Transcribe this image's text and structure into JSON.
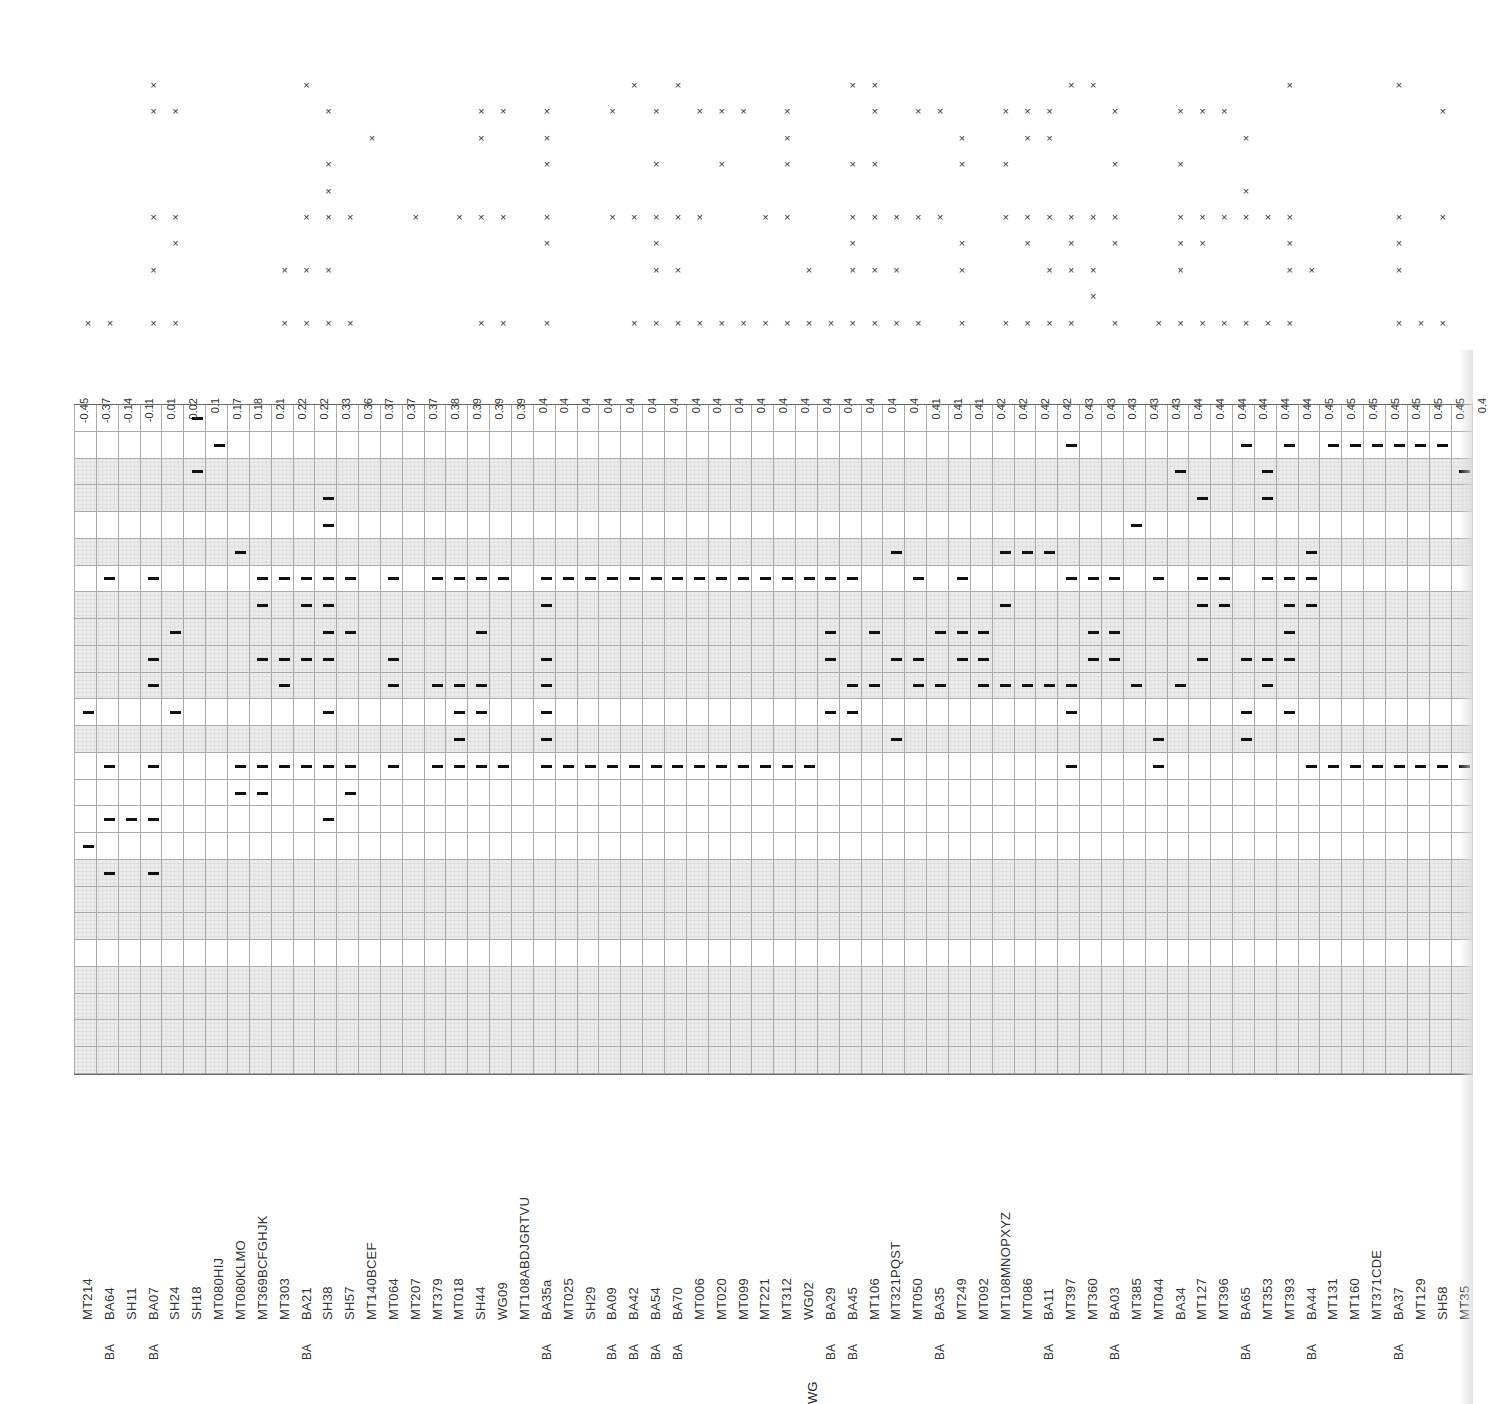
{
  "chart_data": {
    "type": "table",
    "title": "",
    "scores": [
      "-0.45",
      "-0.37",
      "-0.14",
      "-0.11",
      "0.01",
      "0.02",
      "0.1",
      "0.17",
      "0.18",
      "0.21",
      "0.22",
      "0.22",
      "0.33",
      "0.36",
      "0.37",
      "0.37",
      "0.37",
      "0.38",
      "0.39",
      "0.39",
      "0.39",
      "0.4",
      "0.4",
      "0.4",
      "0.4",
      "0.4",
      "0.4",
      "0.4",
      "0.4",
      "0.4",
      "0.4",
      "0.4",
      "0.4",
      "0.4",
      "0.4",
      "0.4",
      "0.4",
      "0.4",
      "0.4",
      "0.41",
      "0.41",
      "0.41",
      "0.42",
      "0.42",
      "0.42",
      "0.42",
      "0.43",
      "0.43",
      "0.43",
      "0.43",
      "0.43",
      "0.44",
      "0.44",
      "0.44",
      "0.44",
      "0.44",
      "0.44",
      "0.45",
      "0.45",
      "0.45",
      "0.45",
      "0.45",
      "0.45",
      "0.45",
      "0.4"
    ],
    "samples": [
      "MT214",
      "BA64",
      "SH11",
      "BA07",
      "SH24",
      "SH18",
      "MT080HIJ",
      "MT080KLMO",
      "MT369BCFGHJK",
      "MT303",
      "BA21",
      "SH38",
      "SH57",
      "MT140BCEF",
      "MT064",
      "MT207",
      "MT379",
      "MT018",
      "SH44",
      "WG09",
      "MT108ABDJGRTVU",
      "BA35a",
      "MT025",
      "SH29",
      "BA09",
      "BA42",
      "BA54",
      "BA70",
      "MT006",
      "MT020",
      "MT099",
      "MT221",
      "MT312",
      "WG02",
      "BA29",
      "BA45",
      "MT106",
      "MT321PQST",
      "MT050",
      "BA35",
      "MT249",
      "MT092",
      "MT108MNOPXYZ",
      "MT086",
      "BA11",
      "MT397",
      "MT360",
      "BA03",
      "MT385",
      "MT044",
      "BA34",
      "MT127",
      "MT396",
      "BA65",
      "MT353",
      "MT393",
      "BA44",
      "MT131",
      "MT160",
      "MT371CDE",
      "BA37",
      "MT129",
      "SH58",
      "MT35"
    ],
    "group_labels": [
      "",
      "BA",
      "",
      "BA",
      "",
      "",
      "",
      "",
      "",
      "",
      "BA",
      "",
      "",
      "",
      "",
      "",
      "",
      "",
      "",
      "",
      "",
      "BA",
      "",
      "",
      "BA",
      "BA",
      "BA",
      "BA",
      "",
      "",
      "",
      "",
      "",
      "",
      "BA",
      "BA",
      "",
      "",
      "",
      "BA",
      "",
      "",
      "",
      "",
      "BA",
      "",
      "",
      "BA",
      "",
      "",
      "",
      "",
      "",
      "BA",
      "",
      "",
      "BA",
      "",
      "",
      "",
      "BA",
      "",
      "",
      ""
    ],
    "group_label_bottom": "WG",
    "cross_rows": 10,
    "crosses": [
      [
        9
      ],
      [
        9
      ],
      [],
      [
        0,
        1,
        5,
        7,
        9
      ],
      [
        1,
        5,
        6,
        9
      ],
      [],
      [],
      [],
      [],
      [
        7,
        9
      ],
      [
        0,
        5,
        7,
        9
      ],
      [
        1,
        3,
        4,
        5,
        7,
        9
      ],
      [
        5,
        9
      ],
      [
        2
      ],
      [],
      [
        5
      ],
      [],
      [
        5
      ],
      [
        1,
        2,
        5,
        9
      ],
      [
        1,
        5,
        9
      ],
      [],
      [
        1,
        2,
        3,
        5,
        6,
        9
      ],
      [],
      [],
      [
        1,
        5
      ],
      [
        0,
        5,
        9
      ],
      [
        1,
        3,
        5,
        6,
        7,
        9
      ],
      [
        0,
        5,
        7,
        9
      ],
      [
        1,
        5,
        9
      ],
      [
        1,
        3,
        9
      ],
      [
        1,
        9
      ],
      [
        5,
        9
      ],
      [
        1,
        2,
        3,
        5,
        9
      ],
      [
        7,
        9
      ],
      [
        9
      ],
      [
        0,
        3,
        5,
        6,
        7,
        9
      ],
      [
        0,
        1,
        3,
        5,
        7,
        9
      ],
      [
        5,
        7,
        9
      ],
      [
        1,
        5,
        9
      ],
      [
        1,
        5
      ],
      [
        2,
        3,
        6,
        7,
        9
      ],
      [],
      [
        1,
        3,
        5,
        9
      ],
      [
        1,
        2,
        5,
        6,
        9
      ],
      [
        1,
        2,
        5,
        7,
        9
      ],
      [
        0,
        5,
        6,
        7,
        9
      ],
      [
        0,
        5,
        7,
        8
      ],
      [
        1,
        3,
        5,
        6,
        9
      ],
      [],
      [
        9
      ],
      [
        1,
        3,
        5,
        6,
        7,
        9
      ],
      [
        1,
        5,
        6,
        9
      ],
      [
        1,
        5,
        9
      ],
      [
        2,
        4,
        5,
        9
      ],
      [
        5,
        9
      ],
      [
        0,
        5,
        6,
        7,
        9
      ],
      [
        7
      ],
      [],
      [],
      [],
      [
        0,
        5,
        6,
        7,
        9
      ],
      [
        9
      ],
      [
        1,
        5,
        9
      ],
      []
    ],
    "grid_rows": 25,
    "grid_row_shading": [
      "w",
      "w",
      "g",
      "g",
      "w",
      "g",
      "w",
      "g",
      "g",
      "g",
      "g",
      "w",
      "g",
      "w",
      "w",
      "w",
      "w",
      "g",
      "g",
      "g",
      "w",
      "g",
      "g",
      "g",
      "g"
    ],
    "dashes": [
      [
        11,
        16
      ],
      [
        6,
        13,
        15,
        17
      ],
      [
        15
      ],
      [
        6,
        9,
        10,
        13,
        15,
        17
      ],
      [
        8,
        11
      ],
      [
        0,
        2
      ],
      [
        1
      ],
      [
        5,
        13,
        14
      ],
      [
        6,
        7,
        9,
        13,
        14
      ],
      [
        6,
        9,
        10,
        13
      ],
      [
        6,
        7,
        9,
        13
      ],
      [
        3,
        4,
        6,
        7,
        8,
        9,
        11,
        13,
        15
      ],
      [
        6,
        8,
        13,
        14
      ],
      [],
      [
        6,
        9,
        10,
        13
      ],
      [],
      [
        6,
        10,
        13
      ],
      [
        6,
        10,
        11,
        12,
        13
      ],
      [
        6,
        8,
        10,
        11,
        13
      ],
      [
        6,
        13
      ],
      [],
      [
        6,
        7,
        9,
        10,
        11,
        12,
        13
      ],
      [
        6,
        13
      ],
      [
        6,
        13
      ],
      [
        6,
        13
      ],
      [
        6,
        13
      ],
      [
        6,
        13
      ],
      [
        6,
        13
      ],
      [
        6,
        13
      ],
      [
        6,
        13
      ],
      [
        6,
        13
      ],
      [
        6,
        13
      ],
      [
        6,
        13
      ],
      [
        6,
        13
      ],
      [
        6,
        8,
        9,
        11
      ],
      [
        6,
        10,
        11
      ],
      [
        8,
        10
      ],
      [
        5,
        9,
        12
      ],
      [
        6,
        9,
        10
      ],
      [
        8,
        10
      ],
      [
        6,
        8,
        9
      ],
      [
        8,
        9,
        10
      ],
      [
        5,
        7,
        10
      ],
      [
        5,
        10
      ],
      [
        5,
        10
      ],
      [
        1,
        6,
        10,
        11,
        13
      ],
      [
        6,
        8,
        9
      ],
      [
        6,
        8,
        9
      ],
      [
        4,
        10
      ],
      [
        6,
        12,
        13
      ],
      [
        2,
        10
      ],
      [
        3,
        6,
        7,
        9
      ],
      [
        6,
        7
      ],
      [
        1,
        9,
        11,
        12
      ],
      [
        2,
        3,
        6,
        9,
        10
      ],
      [
        1,
        6,
        7,
        8,
        9,
        11
      ],
      [
        5,
        6,
        7,
        13
      ],
      [
        1,
        13
      ],
      [
        1,
        13
      ],
      [
        1,
        13
      ],
      [
        1,
        13
      ],
      [
        1,
        13
      ],
      [
        1,
        13
      ],
      [
        2,
        13
      ]
    ]
  }
}
